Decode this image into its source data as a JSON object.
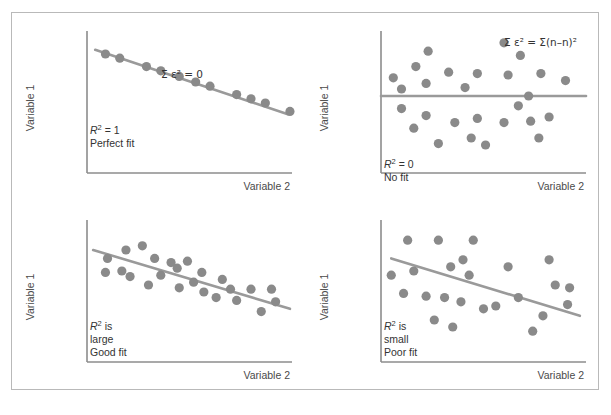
{
  "figure": {
    "border_color": "#b9b9b9",
    "background": "#ffffff",
    "marker_color": "#8a8a8a",
    "line_color": "#9a9a9a",
    "axis_color": "#8c8c8c",
    "text_color": "#333333"
  },
  "common": {
    "y_axis_label": "Variable 1",
    "x_axis_label": "Variable 2"
  },
  "chart_data": [
    {
      "id": "perfect-fit",
      "type": "scatter",
      "title": "",
      "xlabel": "Variable 2",
      "ylabel": "Variable 1",
      "xlim": [
        0,
        100
      ],
      "ylim": [
        0,
        100
      ],
      "grid": false,
      "legend": "none",
      "annotations": {
        "sum_epsilon": "Σ ε² = 0",
        "r_squared": "R² = 1",
        "fit_quality": "Perfect fit"
      },
      "fit_line": {
        "x1": 4,
        "y1": 88,
        "x2": 98,
        "y2": 42
      },
      "points": [
        {
          "x": 9,
          "y": 85
        },
        {
          "x": 16,
          "y": 82
        },
        {
          "x": 29,
          "y": 76
        },
        {
          "x": 36,
          "y": 73
        },
        {
          "x": 45,
          "y": 69
        },
        {
          "x": 53,
          "y": 65
        },
        {
          "x": 60,
          "y": 62
        },
        {
          "x": 73,
          "y": 56
        },
        {
          "x": 80,
          "y": 53
        },
        {
          "x": 87,
          "y": 50
        },
        {
          "x": 99,
          "y": 44
        }
      ]
    },
    {
      "id": "no-fit",
      "type": "scatter",
      "title": "",
      "xlabel": "Variable 2",
      "ylabel": "Variable 1",
      "xlim": [
        0,
        100
      ],
      "ylim": [
        0,
        100
      ],
      "grid": false,
      "legend": "none",
      "annotations": {
        "sum_epsilon": "Σ ε² = Σ(n–n)²",
        "r_squared": "R² = 0",
        "fit_quality": "No fit"
      },
      "fit_line": {
        "x1": 0,
        "y1": 55,
        "x2": 100,
        "y2": 55
      },
      "points": [
        {
          "x": 6,
          "y": 68
        },
        {
          "x": 10,
          "y": 60
        },
        {
          "x": 17,
          "y": 76
        },
        {
          "x": 23,
          "y": 87
        },
        {
          "x": 22,
          "y": 64
        },
        {
          "x": 33,
          "y": 72
        },
        {
          "x": 41,
          "y": 61
        },
        {
          "x": 47,
          "y": 71
        },
        {
          "x": 60,
          "y": 93
        },
        {
          "x": 62,
          "y": 70
        },
        {
          "x": 68,
          "y": 84
        },
        {
          "x": 78,
          "y": 71
        },
        {
          "x": 90,
          "y": 66
        },
        {
          "x": 72,
          "y": 55
        },
        {
          "x": 10,
          "y": 46
        },
        {
          "x": 16,
          "y": 32
        },
        {
          "x": 22,
          "y": 41
        },
        {
          "x": 28,
          "y": 21
        },
        {
          "x": 36,
          "y": 36
        },
        {
          "x": 44,
          "y": 25
        },
        {
          "x": 47,
          "y": 39
        },
        {
          "x": 51,
          "y": 20
        },
        {
          "x": 60,
          "y": 36
        },
        {
          "x": 67,
          "y": 48
        },
        {
          "x": 73,
          "y": 37
        },
        {
          "x": 77,
          "y": 25
        },
        {
          "x": 82,
          "y": 40
        }
      ]
    },
    {
      "id": "good-fit",
      "type": "scatter",
      "title": "",
      "xlabel": "Variable 2",
      "ylabel": "Variable 1",
      "xlim": [
        0,
        100
      ],
      "ylim": [
        0,
        100
      ],
      "grid": false,
      "legend": "none",
      "annotations": {
        "r_squared": "R² is",
        "magnitude": "large",
        "fit_quality": "Good fit"
      },
      "fit_line": {
        "x1": 3,
        "y1": 80,
        "x2": 99,
        "y2": 38
      },
      "points": [
        {
          "x": 10,
          "y": 74
        },
        {
          "x": 9,
          "y": 64
        },
        {
          "x": 17,
          "y": 65
        },
        {
          "x": 19,
          "y": 80
        },
        {
          "x": 21,
          "y": 61
        },
        {
          "x": 27,
          "y": 83
        },
        {
          "x": 30,
          "y": 55
        },
        {
          "x": 33,
          "y": 74
        },
        {
          "x": 36,
          "y": 62
        },
        {
          "x": 41,
          "y": 71
        },
        {
          "x": 44,
          "y": 67
        },
        {
          "x": 45,
          "y": 53
        },
        {
          "x": 49,
          "y": 72
        },
        {
          "x": 52,
          "y": 57
        },
        {
          "x": 56,
          "y": 64
        },
        {
          "x": 57,
          "y": 50
        },
        {
          "x": 63,
          "y": 46
        },
        {
          "x": 66,
          "y": 59
        },
        {
          "x": 70,
          "y": 52
        },
        {
          "x": 73,
          "y": 44
        },
        {
          "x": 80,
          "y": 52
        },
        {
          "x": 85,
          "y": 36
        },
        {
          "x": 90,
          "y": 52
        },
        {
          "x": 92,
          "y": 43
        }
      ]
    },
    {
      "id": "poor-fit",
      "type": "scatter",
      "title": "",
      "xlabel": "Variable 2",
      "ylabel": "Variable 1",
      "xlim": [
        0,
        100
      ],
      "ylim": [
        0,
        100
      ],
      "grid": false,
      "legend": "none",
      "annotations": {
        "r_squared": "R² is",
        "magnitude": "small",
        "fit_quality": "Poor fit"
      },
      "fit_line": {
        "x1": 5,
        "y1": 74,
        "x2": 97,
        "y2": 33
      },
      "points": [
        {
          "x": 5,
          "y": 62
        },
        {
          "x": 13,
          "y": 87
        },
        {
          "x": 16,
          "y": 65
        },
        {
          "x": 11,
          "y": 49
        },
        {
          "x": 22,
          "y": 47
        },
        {
          "x": 28,
          "y": 87
        },
        {
          "x": 31,
          "y": 46
        },
        {
          "x": 26,
          "y": 30
        },
        {
          "x": 34,
          "y": 68
        },
        {
          "x": 40,
          "y": 73
        },
        {
          "x": 43,
          "y": 62
        },
        {
          "x": 39,
          "y": 43
        },
        {
          "x": 35,
          "y": 25
        },
        {
          "x": 45,
          "y": 87
        },
        {
          "x": 50,
          "y": 38
        },
        {
          "x": 56,
          "y": 40
        },
        {
          "x": 62,
          "y": 68
        },
        {
          "x": 67,
          "y": 46
        },
        {
          "x": 74,
          "y": 22
        },
        {
          "x": 79,
          "y": 33
        },
        {
          "x": 82,
          "y": 73
        },
        {
          "x": 85,
          "y": 55
        },
        {
          "x": 92,
          "y": 53
        },
        {
          "x": 91,
          "y": 41
        }
      ]
    }
  ]
}
